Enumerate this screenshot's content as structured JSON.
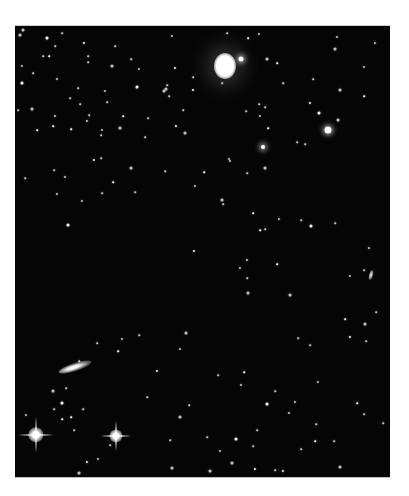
{
  "image": {
    "description": "Black-and-white astronomical photograph of a star field with several galaxies",
    "background_color": "#050505",
    "frame": {
      "x": 15,
      "y": 25,
      "width": 375,
      "height": 451
    }
  },
  "objects": {
    "elliptical_galaxy": {
      "x": 210,
      "y": 40,
      "rx": 11,
      "ry": 13
    },
    "edge_on_galaxy_left": {
      "x": 60,
      "y": 341,
      "w": 34,
      "h": 8,
      "angle": -18
    },
    "small_galaxy_right": {
      "x": 356,
      "y": 249,
      "w": 4,
      "h": 10,
      "angle": 15
    },
    "spiked_stars": [
      {
        "x": 21,
        "y": 409,
        "size": 28
      },
      {
        "x": 101,
        "y": 410,
        "size": 24
      }
    ],
    "bright_stars": [
      {
        "x": 313,
        "y": 104,
        "r": 3.5
      },
      {
        "x": 226,
        "y": 33,
        "r": 2.5
      },
      {
        "x": 248,
        "y": 121,
        "r": 2
      }
    ]
  },
  "stars": [
    [
      32,
      12
    ],
    [
      47,
      7
    ],
    [
      100,
      20
    ],
    [
      157,
      10
    ],
    [
      233,
      12
    ],
    [
      320,
      23
    ],
    [
      360,
      17
    ],
    [
      28,
      30
    ],
    [
      34,
      30
    ],
    [
      7,
      40
    ],
    [
      97,
      40
    ],
    [
      116,
      33
    ],
    [
      160,
      42
    ],
    [
      178,
      51
    ],
    [
      207,
      57
    ],
    [
      252,
      33
    ],
    [
      262,
      37
    ],
    [
      268,
      57
    ],
    [
      349,
      41
    ],
    [
      298,
      53
    ],
    [
      122,
      61
    ],
    [
      90,
      65
    ],
    [
      63,
      62
    ],
    [
      250,
      81
    ],
    [
      295,
      77
    ],
    [
      17,
      83
    ],
    [
      65,
      78
    ],
    [
      72,
      95
    ],
    [
      56,
      103
    ],
    [
      3,
      84
    ],
    [
      8,
      4
    ],
    [
      73,
      36
    ],
    [
      22,
      104
    ],
    [
      40,
      90
    ],
    [
      40,
      20
    ],
    [
      5,
      9
    ],
    [
      69,
      17
    ],
    [
      73,
      30
    ],
    [
      18,
      47
    ],
    [
      42,
      53
    ],
    [
      7,
      57
    ],
    [
      55,
      72
    ],
    [
      124,
      43
    ],
    [
      74,
      89
    ],
    [
      108,
      90
    ],
    [
      149,
      65
    ],
    [
      154,
      70
    ],
    [
      168,
      84
    ],
    [
      161,
      100
    ],
    [
      152,
      59
    ],
    [
      151,
      63
    ],
    [
      244,
      8
    ],
    [
      225,
      33
    ],
    [
      212,
      7
    ],
    [
      322,
      11
    ],
    [
      325,
      64
    ],
    [
      349,
      70
    ],
    [
      245,
      90
    ],
    [
      244,
      78
    ],
    [
      231,
      85
    ],
    [
      304,
      87
    ],
    [
      290,
      118
    ],
    [
      282,
      116
    ],
    [
      214,
      133
    ],
    [
      253,
      102
    ],
    [
      323,
      94
    ],
    [
      50,
      151
    ],
    [
      39,
      144
    ],
    [
      38,
      100
    ],
    [
      87,
      104
    ],
    [
      105,
      102
    ],
    [
      86,
      109
    ],
    [
      79,
      134
    ],
    [
      86,
      132
    ],
    [
      92,
      76
    ],
    [
      116,
      142
    ],
    [
      98,
      156
    ],
    [
      87,
      167
    ],
    [
      42,
      168
    ],
    [
      10,
      152
    ],
    [
      53,
      199
    ],
    [
      67,
      175
    ],
    [
      120,
      166
    ],
    [
      133,
      92
    ],
    [
      178,
      64
    ],
    [
      170,
      107
    ],
    [
      130,
      111
    ],
    [
      232,
      234
    ],
    [
      262,
      238
    ],
    [
      232,
      252
    ],
    [
      275,
      269
    ],
    [
      295,
      319
    ],
    [
      330,
      293
    ],
    [
      354,
      222
    ],
    [
      361,
      286
    ],
    [
      350,
      298
    ],
    [
      335,
      311
    ],
    [
      283,
      312
    ],
    [
      349,
      244
    ],
    [
      335,
      250
    ],
    [
      296,
      200
    ],
    [
      250,
      203
    ],
    [
      225,
      242
    ],
    [
      208,
      178
    ],
    [
      245,
      204
    ],
    [
      233,
      267
    ],
    [
      286,
      194
    ],
    [
      320,
      197
    ],
    [
      179,
      225
    ],
    [
      232,
      147
    ],
    [
      250,
      142
    ],
    [
      215,
      135
    ],
    [
      189,
      146
    ],
    [
      150,
      145
    ],
    [
      180,
      160
    ],
    [
      207,
      174
    ],
    [
      238,
      187
    ],
    [
      264,
      193
    ],
    [
      64,
      335
    ],
    [
      51,
      362
    ],
    [
      47,
      377
    ],
    [
      39,
      383
    ],
    [
      68,
      383
    ],
    [
      11,
      389
    ],
    [
      47,
      393
    ],
    [
      38,
      365
    ],
    [
      107,
      313
    ],
    [
      82,
      317
    ],
    [
      103,
      325
    ],
    [
      165,
      323
    ],
    [
      171,
      307
    ],
    [
      124,
      309
    ],
    [
      142,
      345
    ],
    [
      132,
      371
    ],
    [
      174,
      379
    ],
    [
      165,
      391
    ],
    [
      229,
      346
    ],
    [
      203,
      349
    ],
    [
      226,
      359
    ],
    [
      260,
      365
    ],
    [
      252,
      378
    ],
    [
      280,
      376
    ],
    [
      301,
      398
    ],
    [
      286,
      423
    ],
    [
      268,
      445
    ],
    [
      217,
      437
    ],
    [
      192,
      411
    ],
    [
      303,
      356
    ],
    [
      342,
      377
    ],
    [
      351,
      315
    ],
    [
      157,
      442
    ],
    [
      59,
      404
    ],
    [
      56,
      391
    ],
    [
      83,
      433
    ],
    [
      95,
      419
    ],
    [
      64,
      447
    ],
    [
      72,
      436
    ],
    [
      155,
      414
    ],
    [
      242,
      404
    ],
    [
      205,
      425
    ],
    [
      221,
      413
    ],
    [
      238,
      420
    ],
    [
      274,
      387
    ],
    [
      319,
      415
    ],
    [
      300,
      415
    ],
    [
      325,
      441
    ],
    [
      349,
      388
    ],
    [
      368,
      397
    ],
    [
      240,
      443
    ],
    [
      260,
      444
    ],
    [
      195,
      445
    ]
  ]
}
